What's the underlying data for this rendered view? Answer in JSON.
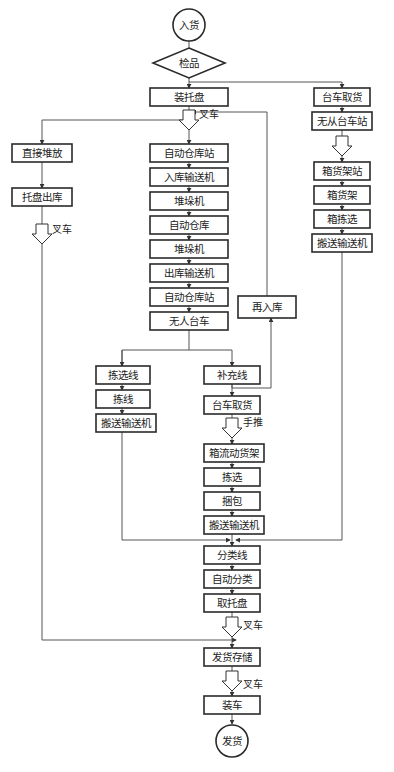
{
  "diagram": {
    "start": "入货",
    "decision": "检品",
    "end": "发货",
    "nodes": {
      "zhuang_tuopan": "装托盘",
      "zhijie_duifang": "直接堆放",
      "tuopan_chuku": "托盘出库",
      "zidong_cangku_zhan_1": "自动仓库站",
      "ruku_shusongji": "入库输送机",
      "duiduoji_1": "堆垛机",
      "zidong_cangku": "自动仓库",
      "duiduoji_2": "堆垛机",
      "chuku_shusongji": "出库输送机",
      "zidong_cangku_zhan_2": "自动仓库站",
      "wuren_taiche": "无人台车",
      "zai_ruku": "再入库",
      "jianxuan_xian": "拣选线",
      "jian_xian": "拣线",
      "banyun_shusongji_left": "搬送输送机",
      "buchong_xian": "补充线",
      "taiche_quhuo_mid": "台车取货",
      "xiangliu_dong_huojia": "箱流动货架",
      "jianxuan": "拣选",
      "kunbao": "捆包",
      "banyun_shusongji_mid": "搬送输送机",
      "fenlei_xian": "分类线",
      "zidong_fenlei": "自动分类",
      "qu_tuopan": "取托盘",
      "fahuo_cunchu": "发货存储",
      "zhuangche": "装车",
      "taiche_quhuo_right": "台车取货",
      "wucong_taiche_zhan": "无从台车站",
      "xiang_huojia_zhan": "箱货架站",
      "xiang_huojia": "箱货架",
      "xiang_jianxuan": "箱拣选",
      "banyun_shusongji_right": "搬送输送机"
    },
    "annotations": {
      "forklift_1": "叉车",
      "forklift_2": "叉车",
      "handcart": "手推",
      "forklift_3": "叉车",
      "forklift_4": "叉车"
    }
  }
}
